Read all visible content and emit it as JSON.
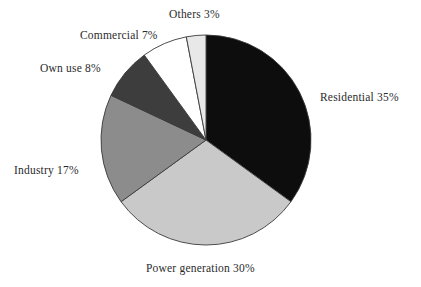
{
  "figure": {
    "background_color": "#ffffff",
    "outline_color": "#3a3a3a"
  },
  "chart_data": {
    "type": "pie",
    "title": "",
    "subtitle": "",
    "xlabel": "",
    "ylabel": "",
    "legend_position": "none",
    "grid": false,
    "labels_outside": true,
    "start_angle_deg": 0,
    "direction": "clockwise",
    "units": "percent",
    "total": 100,
    "categories": [
      "Residential",
      "Power generation",
      "Industry",
      "Own use",
      "Commercial",
      "Others"
    ],
    "values": [
      35,
      30,
      17,
      8,
      7,
      3
    ],
    "colors": [
      "#0d0d0d",
      "#c9c9c9",
      "#8c8c8c",
      "#3d3d3d",
      "#ffffff",
      "#e8e8e8"
    ],
    "slices": [
      {
        "name": "Residential",
        "value": 35,
        "label": "Residential 35%",
        "color": "#0d0d0d",
        "start_deg": 0,
        "end_deg": 126
      },
      {
        "name": "Power generation",
        "value": 30,
        "label": "Power generation 30%",
        "color": "#c9c9c9",
        "start_deg": 126,
        "end_deg": 234
      },
      {
        "name": "Industry",
        "value": 17,
        "label": "Industry 17%",
        "color": "#8c8c8c",
        "start_deg": 234,
        "end_deg": 295.2
      },
      {
        "name": "Own use",
        "value": 8,
        "label": "Own use 8%",
        "color": "#3d3d3d",
        "start_deg": 295.2,
        "end_deg": 324
      },
      {
        "name": "Commercial",
        "value": 7,
        "label": "Commercial 7%",
        "color": "#ffffff",
        "start_deg": 324,
        "end_deg": 349.2
      },
      {
        "name": "Others",
        "value": 3,
        "label": "Others 3%",
        "color": "#e8e8e8",
        "start_deg": 349.2,
        "end_deg": 360
      }
    ]
  },
  "labels": {
    "residential": "Residential 35%",
    "power_generation": "Power generation 30%",
    "industry": "Industry 17%",
    "own_use": "Own use 8%",
    "commercial": "Commercial 7%",
    "others": "Others 3%"
  }
}
